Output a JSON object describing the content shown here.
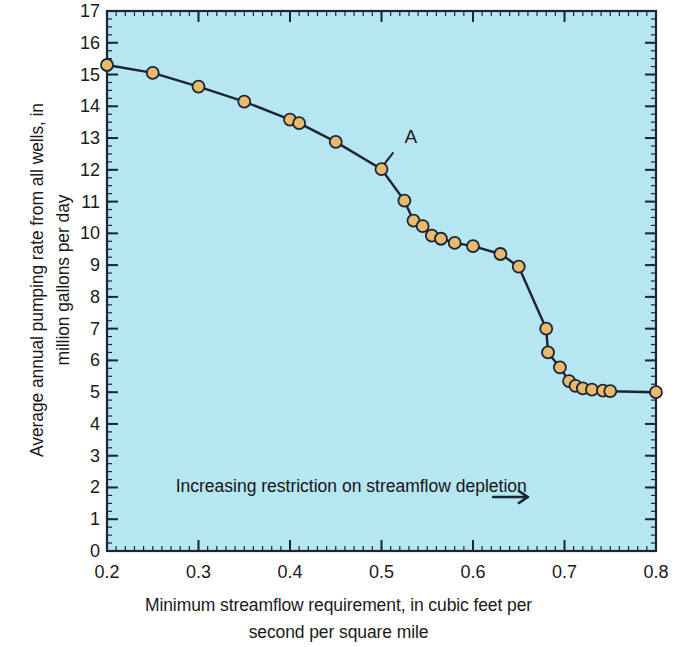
{
  "chart_data": {
    "type": "line",
    "title": "",
    "subtitle": "",
    "xlabel_line1": "Minimum streamflow requirement, in cubic feet per",
    "xlabel_line2": "second per square mile",
    "ylabel_line1": "Average annual pumping rate from all wells, in",
    "ylabel_line2": "million gallons per day",
    "xlim": [
      0.2,
      0.8
    ],
    "ylim": [
      0,
      17
    ],
    "x_major_ticks": [
      0.2,
      0.3,
      0.4,
      0.5,
      0.6,
      0.7,
      0.8
    ],
    "x_tick_labels": [
      "0.2",
      "0.3",
      "0.4",
      "0.5",
      "0.6",
      "0.7",
      "0.8"
    ],
    "x_minor_step": 0.01,
    "y_major_ticks": [
      0,
      1,
      2,
      3,
      4,
      5,
      6,
      7,
      8,
      9,
      10,
      11,
      12,
      13,
      14,
      15,
      16,
      17
    ],
    "y_tick_labels": [
      "0",
      "1",
      "2",
      "3",
      "4",
      "5",
      "6",
      "7",
      "8",
      "9",
      "10",
      "11",
      "12",
      "13",
      "14",
      "15",
      "16",
      "17"
    ],
    "y_minor_step": 0.25,
    "grid": false,
    "legend": "none",
    "plot_background_color": "#b6e6f2",
    "line_color": "#1b2430",
    "marker_fill_color": "#e8b96e",
    "marker_edge_color": "#1b2430",
    "marker_radius": 6,
    "series": [
      {
        "name": "Pumping rate vs minimum streamflow requirement",
        "points": [
          [
            0.2,
            15.3
          ],
          [
            0.25,
            15.05
          ],
          [
            0.3,
            14.62
          ],
          [
            0.35,
            14.15
          ],
          [
            0.4,
            13.58
          ],
          [
            0.41,
            13.47
          ],
          [
            0.45,
            12.88
          ],
          [
            0.5,
            12.02
          ],
          [
            0.525,
            11.03
          ],
          [
            0.535,
            10.4
          ],
          [
            0.545,
            10.23
          ],
          [
            0.555,
            9.93
          ],
          [
            0.565,
            9.83
          ],
          [
            0.58,
            9.7
          ],
          [
            0.6,
            9.6
          ],
          [
            0.63,
            9.35
          ],
          [
            0.65,
            8.95
          ],
          [
            0.68,
            7.0
          ],
          [
            0.682,
            6.25
          ],
          [
            0.695,
            5.78
          ],
          [
            0.705,
            5.35
          ],
          [
            0.712,
            5.2
          ],
          [
            0.72,
            5.12
          ],
          [
            0.73,
            5.08
          ],
          [
            0.742,
            5.05
          ],
          [
            0.75,
            5.03
          ],
          [
            0.8,
            5.0
          ]
        ]
      }
    ],
    "annotations": [
      {
        "name": "curve-label-a",
        "text": "A",
        "text_x": 0.525,
        "text_y": 12.85,
        "leader_from_x": 0.513,
        "leader_from_y": 12.55,
        "leader_to_x": 0.503,
        "leader_to_y": 12.18
      },
      {
        "name": "direction-note",
        "text": "Increasing restriction on streamflow depletion",
        "arrow_glyph": "→",
        "text_x": 0.275,
        "text_y": 1.85,
        "arrow_start_x": 0.622,
        "arrow_end_x": 0.66,
        "arrow_y": 1.7
      }
    ]
  }
}
